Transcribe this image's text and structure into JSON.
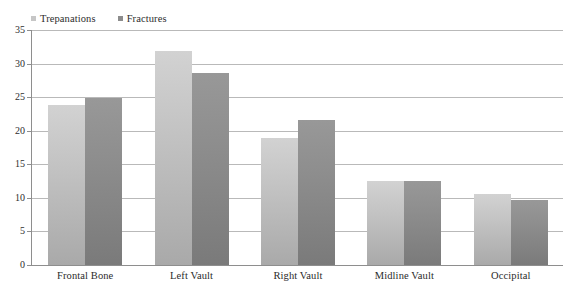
{
  "chart_data": {
    "type": "bar",
    "title": "",
    "subtitle": "",
    "xlabel": "",
    "ylabel": "",
    "categories": [
      "Frontal Bone",
      "Left Vault",
      "Right Vault",
      "Midline Vault",
      "Occipital"
    ],
    "series": [
      {
        "name": "Trepanations",
        "color": "#c6c6c6",
        "values": [
          24,
          32,
          19,
          12.7,
          10.7
        ]
      },
      {
        "name": "Fractures",
        "color": "#8c8c8c",
        "values": [
          25,
          28.8,
          21.7,
          12.7,
          9.8
        ]
      }
    ],
    "ylim": [
      0,
      35
    ],
    "yticks": [
      0,
      5,
      10,
      15,
      20,
      25,
      30,
      35
    ],
    "ytick_labels": [
      "0",
      "5",
      "10",
      "15",
      "20",
      "25",
      "30",
      "35"
    ],
    "grid": true,
    "grid_axis": "y",
    "legend_position": "top-left",
    "background": "#ffffff",
    "axis_color": "#8e8e8e",
    "gridline_color": "#b9b9b9"
  }
}
